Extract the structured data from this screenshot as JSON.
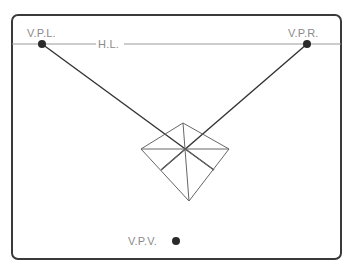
{
  "diagram": {
    "title": "",
    "labels": {
      "vpl": "V.P.L.",
      "vpr": "V.P.R.",
      "hl": "H.L.",
      "vpv": "V.P.V."
    },
    "colors": {
      "frame": "#3a3a3a",
      "horizon": "#9a9a9a",
      "construction": "#333333",
      "shape": "#666666",
      "label": "#8a8a8a",
      "point": "#2a2a2a"
    },
    "points": {
      "vpl": [
        42,
        44
      ],
      "vpr": [
        307,
        44
      ],
      "vpv": [
        176,
        241
      ],
      "center": [
        185,
        149
      ],
      "top": [
        183,
        123
      ],
      "left": [
        141,
        149
      ],
      "right": [
        229,
        149
      ],
      "bottom": [
        189,
        201
      ],
      "lower_left": [
        161,
        170
      ],
      "lower_right": [
        214,
        170
      ]
    }
  }
}
